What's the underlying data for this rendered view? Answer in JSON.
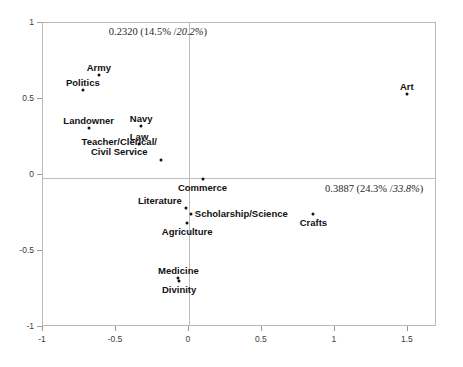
{
  "chart_data": {
    "type": "scatter",
    "title": "",
    "subtitle": "",
    "xlabel": "",
    "ylabel": "",
    "xlim": [
      -1,
      1.7
    ],
    "ylim": [
      -1,
      1
    ],
    "grid": false,
    "legend": "none",
    "xticks": [
      "-1",
      "-0.5",
      "0",
      "0.5",
      "1",
      "1.5"
    ],
    "xtick_values": [
      -1,
      -0.5,
      0,
      0.5,
      1,
      1.5
    ],
    "yticks": [
      "1",
      "0.5",
      "0",
      "-0.5",
      "-1"
    ],
    "ytick_values": [
      1,
      0.5,
      0,
      -0.5,
      -1
    ],
    "axis_annotations": {
      "vertical_axis": {
        "eigenvalue": "0.2320",
        "percent_pair": "(14.5% /20.2%)",
        "full": "0.2320 (14.5% /20.2%)",
        "inertia_percent": 14.5,
        "cumulative_percent": 20.2
      },
      "horizontal_axis": {
        "eigenvalue": "0.3887",
        "percent_pair": "(24.3% /33.8%)",
        "full": "0.3887 (24.3% /33.8%)",
        "inertia_percent": 24.3,
        "cumulative_percent": 33.8
      }
    },
    "points": [
      {
        "label": "Army",
        "x": -0.61,
        "y": 0.65,
        "label_dx": 0,
        "label_dy": -12,
        "anchor": "center",
        "lines": [
          "Army"
        ]
      },
      {
        "label": "Politics",
        "x": -0.72,
        "y": 0.555,
        "label_dx": 0,
        "label_dy": -12,
        "anchor": "center",
        "lines": [
          "Politics"
        ]
      },
      {
        "label": "Art",
        "x": 1.5,
        "y": 0.525,
        "label_dx": 0,
        "label_dy": -12,
        "anchor": "center",
        "lines": [
          "Art"
        ]
      },
      {
        "label": "Landowner",
        "x": -0.68,
        "y": 0.3,
        "label_dx": 0,
        "label_dy": -12,
        "anchor": "center",
        "lines": [
          "Landowner"
        ]
      },
      {
        "label": "Navy",
        "x": -0.32,
        "y": 0.315,
        "label_dx": 0,
        "label_dy": -12,
        "anchor": "center",
        "lines": [
          "Navy"
        ]
      },
      {
        "label": "Law",
        "x": -0.335,
        "y": 0.195,
        "label_dx": 0,
        "label_dy": -12,
        "anchor": "center",
        "lines": [
          "Law"
        ]
      },
      {
        "label": "Teacher/Clerical/ Civil Service",
        "x": -0.185,
        "y": 0.095,
        "label_dx": -4,
        "label_dy": -23,
        "anchor": "right",
        "lines": [
          "Teacher/Clerical/",
          "Civil Service"
        ]
      },
      {
        "label": "Commerce",
        "x": 0.1,
        "y": -0.035,
        "label_dx": 0,
        "label_dy": 4,
        "anchor": "center",
        "lines": [
          "Commerce"
        ]
      },
      {
        "label": "Literature",
        "x": -0.015,
        "y": -0.225,
        "label_dx": -4,
        "label_dy": -12,
        "anchor": "right",
        "lines": [
          "Literature"
        ]
      },
      {
        "label": "Scholarship/Science",
        "x": 0.02,
        "y": -0.265,
        "label_dx": 4,
        "label_dy": -5,
        "anchor": "left",
        "lines": [
          "Scholarship/Science"
        ]
      },
      {
        "label": "Crafts",
        "x": 0.86,
        "y": -0.265,
        "label_dx": 0,
        "label_dy": 4,
        "anchor": "center",
        "lines": [
          "Crafts"
        ]
      },
      {
        "label": "Agriculture",
        "x": -0.005,
        "y": -0.325,
        "label_dx": 0,
        "label_dy": 4,
        "anchor": "center",
        "lines": [
          "Agriculture"
        ]
      },
      {
        "label": "Medicine",
        "x": -0.065,
        "y": -0.685,
        "label_dx": 0,
        "label_dy": -12,
        "anchor": "center",
        "lines": [
          "Medicine"
        ]
      },
      {
        "label": "Divinity",
        "x": -0.06,
        "y": -0.705,
        "label_dx": 0,
        "label_dy": 4,
        "anchor": "center",
        "lines": [
          "Divinity"
        ]
      }
    ]
  }
}
